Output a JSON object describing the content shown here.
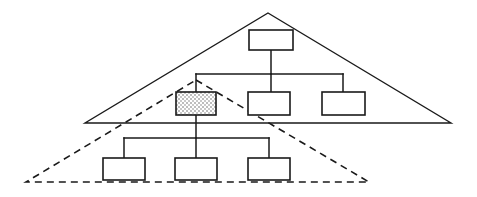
{
  "diagram": {
    "type": "tree-diagram",
    "canvas": {
      "width": 477,
      "height": 197,
      "background": "#ffffff"
    },
    "colors": {
      "stroke": "#1a1a1a",
      "box_fill": "#ffffff",
      "shaded_fill": "#d9d9d9",
      "shaded_dot": "#9a9a9a"
    },
    "scopes": [
      {
        "name": "outer-scope-triangle",
        "style": "solid",
        "apex": {
          "x": 268,
          "y": 13
        },
        "left": {
          "x": 85,
          "y": 123
        },
        "right": {
          "x": 451,
          "y": 123
        },
        "label": ""
      },
      {
        "name": "inner-scope-triangle",
        "style": "dashed",
        "apex": {
          "x": 196,
          "y": 80
        },
        "left": {
          "x": 26,
          "y": 182
        },
        "right": {
          "x": 369,
          "y": 182
        },
        "label": ""
      }
    ],
    "nodes": [
      {
        "id": "root",
        "label": "",
        "x": 249,
        "y": 30,
        "w": 44,
        "h": 20,
        "shaded": false
      },
      {
        "id": "child-a",
        "label": "",
        "x": 176,
        "y": 92,
        "w": 40,
        "h": 23,
        "shaded": true
      },
      {
        "id": "child-b",
        "label": "",
        "x": 248,
        "y": 92,
        "w": 42,
        "h": 23,
        "shaded": false
      },
      {
        "id": "child-c",
        "label": "",
        "x": 322,
        "y": 92,
        "w": 43,
        "h": 23,
        "shaded": false
      },
      {
        "id": "grandchild-a",
        "label": "",
        "x": 103,
        "y": 158,
        "w": 42,
        "h": 22,
        "shaded": false
      },
      {
        "id": "grandchild-b",
        "label": "",
        "x": 175,
        "y": 158,
        "w": 42,
        "h": 22,
        "shaded": false
      },
      {
        "id": "grandchild-c",
        "label": "",
        "x": 248,
        "y": 158,
        "w": 42,
        "h": 22,
        "shaded": false
      }
    ],
    "connectors": [
      {
        "name": "root-stem",
        "points": "271,50 271,74"
      },
      {
        "name": "upper-bus",
        "points": "196,74 343,74"
      },
      {
        "name": "bus-drop-a",
        "points": "196,74 196,92"
      },
      {
        "name": "bus-drop-b",
        "points": "271,74 271,92"
      },
      {
        "name": "bus-drop-c",
        "points": "343,74 343,92"
      },
      {
        "name": "shaded-stem",
        "points": "196,115 196,138"
      },
      {
        "name": "lower-bus",
        "points": "124,138 269,138"
      },
      {
        "name": "lower-drop-a",
        "points": "124,138 124,158"
      },
      {
        "name": "lower-drop-b",
        "points": "196,138 196,158"
      },
      {
        "name": "lower-drop-c",
        "points": "269,138 269,158"
      }
    ]
  }
}
